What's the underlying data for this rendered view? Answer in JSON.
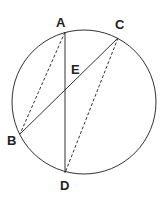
{
  "diagram": {
    "type": "circle-geometry",
    "circle": {
      "cx": 84,
      "cy": 102,
      "r": 72
    },
    "points": {
      "A": {
        "label": "A",
        "x": 65,
        "y": 32,
        "label_x": 61,
        "label_y": 27
      },
      "B": {
        "label": "B",
        "x": 20,
        "y": 134,
        "label_x": 11,
        "label_y": 145
      },
      "C": {
        "label": "C",
        "x": 118,
        "y": 38,
        "label_x": 120,
        "label_y": 29
      },
      "D": {
        "label": "D",
        "x": 65,
        "y": 173,
        "label_x": 64,
        "label_y": 190
      },
      "E": {
        "label": "E",
        "x": 65,
        "y": 92,
        "label_x": 75,
        "label_y": 74
      }
    },
    "segments": [
      {
        "from": "A",
        "to": "D",
        "style": "solid"
      },
      {
        "from": "B",
        "to": "C",
        "style": "solid"
      },
      {
        "from": "A",
        "to": "B",
        "style": "dashed"
      },
      {
        "from": "C",
        "to": "D",
        "style": "dashed"
      }
    ],
    "colors": {
      "stroke": "#333333",
      "label": "#222222",
      "background": "#ffffff"
    }
  }
}
